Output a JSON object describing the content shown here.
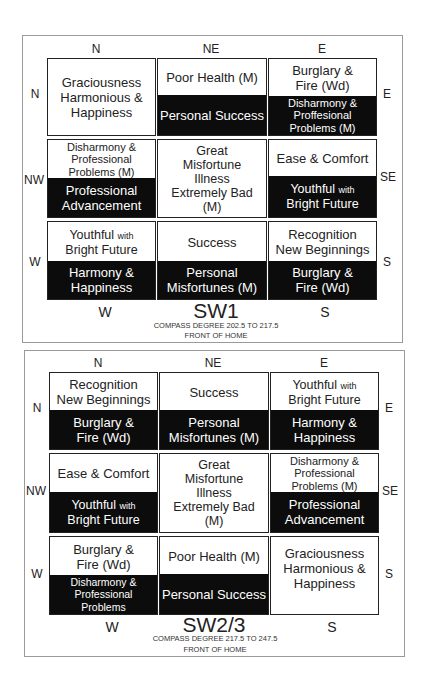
{
  "diagrams": [
    {
      "title": "SW1",
      "compass_degree": "COMPASS DEGREE 202.5 TO 217.5",
      "front": "FRONT OF HOME",
      "top_labels": [
        "N",
        "NE",
        "E"
      ],
      "left_labels": [
        "N",
        "NW",
        "W"
      ],
      "right_labels": [
        "E",
        "SE",
        "S"
      ],
      "bottom_labels": [
        "W",
        "S"
      ],
      "cells": [
        {
          "top": "Graciousness\nHarmonious &\nHappiness",
          "bottom": ""
        },
        {
          "top": "Poor Health (M)",
          "bottom": "Personal Success"
        },
        {
          "top": "Burglary &\nFire (Wd)",
          "bottom": "Disharmony &\nProffesional\nProblems (M)"
        },
        {
          "top": "Disharmony &\nProfessional\nProblems (M)",
          "bottom": "Professional\nAdvancement"
        },
        {
          "top": "Great\nMisfortune\nIllness\nExtremely Bad\n(M)",
          "bottom": ""
        },
        {
          "top": "Ease & Comfort",
          "bottom_main": "Youthful",
          "bottom_small": "with",
          "bottom_line2": "Bright Future"
        },
        {
          "top_main": "Youthful",
          "top_small": "with",
          "top_line2": "Bright Future",
          "bottom": "Harmony &\nHappiness"
        },
        {
          "top": "Success",
          "bottom": "Personal\nMisfortunes (M)"
        },
        {
          "top": "Recognition\nNew Beginnings",
          "bottom": "Burglary &\nFire (Wd)"
        }
      ]
    },
    {
      "title": "SW2/3",
      "compass_degree": "COMPASS DEGREE 217.5 TO 247.5",
      "front": "FRONT OF HOME",
      "top_labels": [
        "N",
        "NE",
        "E"
      ],
      "left_labels": [
        "N",
        "NW",
        "W"
      ],
      "right_labels": [
        "E",
        "SE",
        "S"
      ],
      "bottom_labels": [
        "W",
        "S"
      ],
      "cells": [
        {
          "top": "Recognition\nNew Beginnings",
          "bottom": "Burglary &\nFire (Wd)"
        },
        {
          "top": "Success",
          "bottom": "Personal\nMisfortunes (M)"
        },
        {
          "top_main": "Youthful",
          "top_small": "with",
          "top_line2": "Bright Future",
          "bottom": "Harmony &\nHappiness"
        },
        {
          "top": "Ease & Comfort",
          "bottom_main": "Youthful",
          "bottom_small": "with",
          "bottom_line2": "Bright Future"
        },
        {
          "top": "Great\nMisfortune\nIllness\nExtremely Bad\n(M)",
          "bottom": ""
        },
        {
          "top": "Disharmony &\nProfessional\nProblems (M)",
          "bottom": "Professional\nAdvancement"
        },
        {
          "top": "Burglary &\nFire (Wd)",
          "bottom": "Disharmony &\nProfessional Problems"
        },
        {
          "top": "Poor Health (M)",
          "bottom": "Personal Success"
        },
        {
          "top": "Graciousness\nHarmonious &\nHappiness",
          "bottom": ""
        }
      ]
    }
  ]
}
